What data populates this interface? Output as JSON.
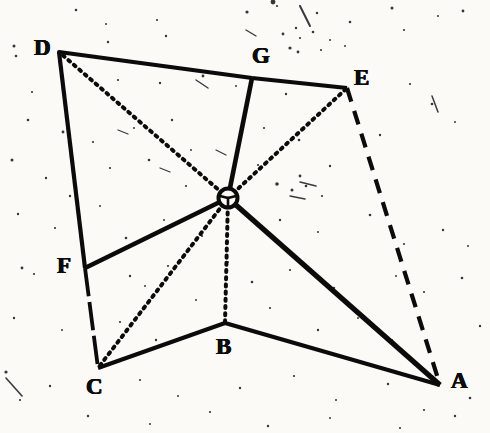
{
  "figure": {
    "background_color": "#fbfaf7",
    "ink_color": "#0b0b0b",
    "width": 490,
    "height": 433,
    "vertices": [
      {
        "id": "D",
        "label": "D",
        "x": 59,
        "y": 52,
        "label_x": 34,
        "label_y": 36
      },
      {
        "id": "G",
        "label": "G",
        "x": 252,
        "y": 78,
        "label_x": 252,
        "label_y": 44
      },
      {
        "id": "E",
        "label": "E",
        "x": 347,
        "y": 88,
        "label_x": 354,
        "label_y": 66
      },
      {
        "id": "A",
        "label": "A",
        "x": 440,
        "y": 385,
        "label_x": 451,
        "label_y": 369
      },
      {
        "id": "B",
        "label": "B",
        "x": 225,
        "y": 323,
        "label_x": 216,
        "label_y": 335
      },
      {
        "id": "C",
        "label": "C",
        "x": 98,
        "y": 368,
        "label_x": 86,
        "label_y": 375
      },
      {
        "id": "F",
        "label": "F",
        "x": 85,
        "y": 268,
        "label_x": 57,
        "label_y": 254
      },
      {
        "id": "O",
        "label": "",
        "x": 228,
        "y": 198,
        "label_x": 228,
        "label_y": 198
      }
    ],
    "hub": {
      "id": "O",
      "x": 228,
      "y": 198,
      "radius": 9.5,
      "stroke_width": 4
    },
    "edges": [
      {
        "id": "D-G",
        "from": "D",
        "to": "G",
        "style": "solid",
        "width": 4.2
      },
      {
        "id": "G-E",
        "from": "G",
        "to": "E",
        "style": "solid",
        "width": 4.2
      },
      {
        "id": "D-F",
        "from": "D",
        "to": "F",
        "style": "solid",
        "width": 4.2
      },
      {
        "id": "F-C",
        "from": "F",
        "to": "C",
        "style": "broken",
        "width": 3.8
      },
      {
        "id": "C-B",
        "from": "C",
        "to": "B",
        "style": "solid",
        "width": 4.0
      },
      {
        "id": "B-A",
        "from": "B",
        "to": "A",
        "style": "solid",
        "width": 4.0
      },
      {
        "id": "E-A",
        "from": "E",
        "to": "A",
        "style": "dashed",
        "width": 4.2
      },
      {
        "id": "O-D",
        "from": "O",
        "to": "D",
        "style": "dotted",
        "width": 4.0
      },
      {
        "id": "O-G",
        "from": "O",
        "to": "G",
        "style": "solid",
        "width": 4.6
      },
      {
        "id": "O-E",
        "from": "O",
        "to": "E",
        "style": "dotted",
        "width": 4.0
      },
      {
        "id": "O-A",
        "from": "O",
        "to": "A",
        "style": "solid",
        "width": 5.2
      },
      {
        "id": "O-B",
        "from": "O",
        "to": "B",
        "style": "dotted",
        "width": 4.0
      },
      {
        "id": "O-C",
        "from": "O",
        "to": "C",
        "style": "dotted",
        "width": 4.0
      },
      {
        "id": "O-F",
        "from": "O",
        "to": "F",
        "style": "solid",
        "width": 4.6
      }
    ],
    "speckles": [
      {
        "x": 76,
        "y": 10,
        "r": 1.3
      },
      {
        "x": 247,
        "y": 12,
        "r": 1.6
      },
      {
        "x": 317,
        "y": 13,
        "r": 1.2
      },
      {
        "x": 392,
        "y": 8,
        "r": 1.5
      },
      {
        "x": 463,
        "y": 11,
        "r": 1.4
      },
      {
        "x": 277,
        "y": 6,
        "r": 1.1
      },
      {
        "x": 106,
        "y": 24,
        "r": 1.0
      },
      {
        "x": 157,
        "y": 20,
        "r": 1.1
      },
      {
        "x": 350,
        "y": 22,
        "r": 1.3
      },
      {
        "x": 296,
        "y": 28,
        "r": 1.2
      },
      {
        "x": 438,
        "y": 16,
        "r": 1.0
      },
      {
        "x": 404,
        "y": 30,
        "r": 1.1
      },
      {
        "x": 108,
        "y": 42,
        "r": 1.2
      },
      {
        "x": 14,
        "y": 46,
        "r": 1.5
      },
      {
        "x": 273,
        "y": 2,
        "r": 2.4
      },
      {
        "x": 283,
        "y": 34,
        "r": 1.4
      },
      {
        "x": 300,
        "y": 38,
        "r": 1.1
      },
      {
        "x": 313,
        "y": 32,
        "r": 1.3
      },
      {
        "x": 330,
        "y": 40,
        "r": 1.0
      },
      {
        "x": 166,
        "y": 36,
        "r": 1.2
      },
      {
        "x": 290,
        "y": 48,
        "r": 1.6
      },
      {
        "x": 298,
        "y": 52,
        "r": 1.4
      },
      {
        "x": 321,
        "y": 50,
        "r": 1.1
      },
      {
        "x": 345,
        "y": 46,
        "r": 1.0
      },
      {
        "x": 28,
        "y": 120,
        "r": 1.3
      },
      {
        "x": 118,
        "y": 80,
        "r": 1.1
      },
      {
        "x": 160,
        "y": 83,
        "r": 1.2
      },
      {
        "x": 203,
        "y": 76,
        "r": 1.4
      },
      {
        "x": 236,
        "y": 86,
        "r": 1.0
      },
      {
        "x": 286,
        "y": 94,
        "r": 1.2
      },
      {
        "x": 410,
        "y": 84,
        "r": 1.1
      },
      {
        "x": 432,
        "y": 104,
        "r": 1.3
      },
      {
        "x": 455,
        "y": 122,
        "r": 1.0
      },
      {
        "x": 63,
        "y": 132,
        "r": 1.4
      },
      {
        "x": 93,
        "y": 142,
        "r": 1.1
      },
      {
        "x": 134,
        "y": 128,
        "r": 1.0
      },
      {
        "x": 172,
        "y": 120,
        "r": 1.2
      },
      {
        "x": 264,
        "y": 128,
        "r": 1.1
      },
      {
        "x": 299,
        "y": 140,
        "r": 1.3
      },
      {
        "x": 380,
        "y": 135,
        "r": 1.2
      },
      {
        "x": 12,
        "y": 160,
        "r": 1.5
      },
      {
        "x": 46,
        "y": 178,
        "r": 1.2
      },
      {
        "x": 110,
        "y": 168,
        "r": 1.1
      },
      {
        "x": 149,
        "y": 160,
        "r": 1.3
      },
      {
        "x": 191,
        "y": 150,
        "r": 1.0
      },
      {
        "x": 258,
        "y": 165,
        "r": 1.1
      },
      {
        "x": 300,
        "y": 176,
        "r": 1.4
      },
      {
        "x": 330,
        "y": 166,
        "r": 1.2
      },
      {
        "x": 277,
        "y": 184,
        "r": 1.8
      },
      {
        "x": 292,
        "y": 190,
        "r": 1.5
      },
      {
        "x": 306,
        "y": 186,
        "r": 1.3
      },
      {
        "x": 322,
        "y": 196,
        "r": 1.1
      },
      {
        "x": 18,
        "y": 214,
        "r": 1.2
      },
      {
        "x": 55,
        "y": 228,
        "r": 1.1
      },
      {
        "x": 126,
        "y": 238,
        "r": 1.3
      },
      {
        "x": 164,
        "y": 220,
        "r": 1.0
      },
      {
        "x": 202,
        "y": 236,
        "r": 1.1
      },
      {
        "x": 280,
        "y": 220,
        "r": 1.2
      },
      {
        "x": 318,
        "y": 232,
        "r": 1.0
      },
      {
        "x": 370,
        "y": 215,
        "r": 1.3
      },
      {
        "x": 404,
        "y": 244,
        "r": 1.1
      },
      {
        "x": 443,
        "y": 230,
        "r": 1.2
      },
      {
        "x": 468,
        "y": 246,
        "r": 1.0
      },
      {
        "x": 22,
        "y": 268,
        "r": 1.4
      },
      {
        "x": 34,
        "y": 274,
        "r": 1.1
      },
      {
        "x": 130,
        "y": 276,
        "r": 1.2
      },
      {
        "x": 145,
        "y": 286,
        "r": 1.0
      },
      {
        "x": 168,
        "y": 266,
        "r": 1.1
      },
      {
        "x": 228,
        "y": 262,
        "r": 1.0
      },
      {
        "x": 252,
        "y": 282,
        "r": 1.3
      },
      {
        "x": 290,
        "y": 270,
        "r": 1.1
      },
      {
        "x": 334,
        "y": 288,
        "r": 1.2
      },
      {
        "x": 396,
        "y": 276,
        "r": 1.0
      },
      {
        "x": 424,
        "y": 292,
        "r": 1.1
      },
      {
        "x": 462,
        "y": 278,
        "r": 1.3
      },
      {
        "x": 14,
        "y": 318,
        "r": 1.2
      },
      {
        "x": 62,
        "y": 330,
        "r": 1.0
      },
      {
        "x": 120,
        "y": 322,
        "r": 1.1
      },
      {
        "x": 156,
        "y": 340,
        "r": 1.2
      },
      {
        "x": 196,
        "y": 300,
        "r": 1.0
      },
      {
        "x": 270,
        "y": 308,
        "r": 1.1
      },
      {
        "x": 318,
        "y": 330,
        "r": 1.2
      },
      {
        "x": 358,
        "y": 318,
        "r": 1.0
      },
      {
        "x": 392,
        "y": 340,
        "r": 1.1
      },
      {
        "x": 480,
        "y": 326,
        "r": 1.2
      },
      {
        "x": 6,
        "y": 372,
        "r": 1.6
      },
      {
        "x": 50,
        "y": 386,
        "r": 1.2
      },
      {
        "x": 140,
        "y": 380,
        "r": 1.1
      },
      {
        "x": 178,
        "y": 396,
        "r": 1.0
      },
      {
        "x": 240,
        "y": 388,
        "r": 1.2
      },
      {
        "x": 294,
        "y": 376,
        "r": 1.1
      },
      {
        "x": 336,
        "y": 400,
        "r": 1.0
      },
      {
        "x": 388,
        "y": 384,
        "r": 1.2
      },
      {
        "x": 424,
        "y": 410,
        "r": 1.1
      },
      {
        "x": 470,
        "y": 398,
        "r": 1.3
      },
      {
        "x": 88,
        "y": 416,
        "r": 1.2
      },
      {
        "x": 150,
        "y": 424,
        "r": 1.0
      },
      {
        "x": 210,
        "y": 412,
        "r": 1.1
      },
      {
        "x": 268,
        "y": 426,
        "r": 1.2
      },
      {
        "x": 330,
        "y": 418,
        "r": 1.0
      },
      {
        "x": 400,
        "y": 428,
        "r": 1.1
      },
      {
        "x": 455,
        "y": 416,
        "r": 1.2
      },
      {
        "x": 20,
        "y": 400,
        "r": 1.1
      },
      {
        "x": 16,
        "y": 56,
        "r": 1.3
      },
      {
        "x": 32,
        "y": 92,
        "r": 1.1
      },
      {
        "x": 70,
        "y": 196,
        "r": 1.2
      },
      {
        "x": 100,
        "y": 206,
        "r": 1.0
      },
      {
        "x": 186,
        "y": 186,
        "r": 1.1
      }
    ],
    "streaks": [
      {
        "x1": 6,
        "y1": 378,
        "x2": 22,
        "y2": 396,
        "w": 1.6
      },
      {
        "x1": 300,
        "y1": 6,
        "x2": 310,
        "y2": 26,
        "w": 2.0
      },
      {
        "x1": 432,
        "y1": 96,
        "x2": 438,
        "y2": 112,
        "w": 1.5
      },
      {
        "x1": 196,
        "y1": 80,
        "x2": 208,
        "y2": 88,
        "w": 1.4
      },
      {
        "x1": 216,
        "y1": 150,
        "x2": 226,
        "y2": 155,
        "w": 1.3
      },
      {
        "x1": 300,
        "y1": 182,
        "x2": 316,
        "y2": 186,
        "w": 1.5
      },
      {
        "x1": 290,
        "y1": 196,
        "x2": 305,
        "y2": 199,
        "w": 1.4
      },
      {
        "x1": 160,
        "y1": 168,
        "x2": 170,
        "y2": 172,
        "w": 1.3
      },
      {
        "x1": 118,
        "y1": 130,
        "x2": 128,
        "y2": 134,
        "w": 1.3
      },
      {
        "x1": 246,
        "y1": 30,
        "x2": 256,
        "y2": 36,
        "w": 1.4
      }
    ]
  }
}
